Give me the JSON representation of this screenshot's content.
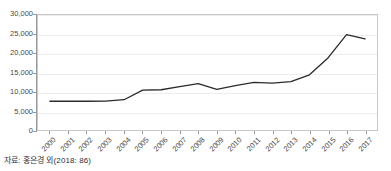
{
  "figure": {
    "title_clipped": "",
    "source_note": "자료: 홍은경 외(2018: 86)"
  },
  "colors": {
    "line": "#2b2b2b",
    "grid": "#ededed",
    "frame": "#c8c8c8",
    "axis": "#9a9a9a",
    "text": "#4a4a4a",
    "background": "#ffffff"
  },
  "chart_data": {
    "type": "line",
    "title": "",
    "xlabel": "",
    "ylabel": "",
    "categories": [
      "2000",
      "2001",
      "2002",
      "2003",
      "2004",
      "2005",
      "2006",
      "2007",
      "2008",
      "2009",
      "2010",
      "2011",
      "2012",
      "2013",
      "2014",
      "2015",
      "2016",
      "2017"
    ],
    "values": [
      7500,
      7500,
      7500,
      7550,
      7900,
      10400,
      10500,
      11300,
      12100,
      10600,
      11600,
      12400,
      12200,
      12600,
      14400,
      18800,
      24900,
      23800
    ],
    "series": [
      {
        "name": "",
        "values": [
          7500,
          7500,
          7500,
          7550,
          7900,
          10400,
          10500,
          11300,
          12100,
          10600,
          11600,
          12400,
          12200,
          12600,
          14400,
          18800,
          24900,
          23800
        ]
      }
    ],
    "ylim": [
      0,
      30000
    ],
    "yticks": [
      0,
      5000,
      10000,
      15000,
      20000,
      25000,
      30000
    ],
    "ytick_labels": [
      "0",
      "5,000",
      "10,000",
      "15,000",
      "20,000",
      "25,000",
      "30,000"
    ],
    "grid": true,
    "grid_axis": "y",
    "legend": false,
    "legend_position": "none",
    "markers": false,
    "xtick_rotation": -45
  }
}
